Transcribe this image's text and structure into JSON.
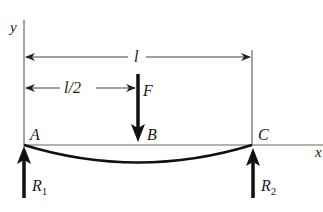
{
  "diagram": {
    "type": "simply-supported-beam",
    "axes": {
      "x_label": "x",
      "y_label": "y"
    },
    "points": [
      {
        "label": "A",
        "description": "left support"
      },
      {
        "label": "B",
        "description": "load point at midspan"
      },
      {
        "label": "C",
        "description": "right support"
      }
    ],
    "dimensions": {
      "span_label": "l",
      "half_span_label": "l/2"
    },
    "load": {
      "label": "F",
      "direction": "down"
    },
    "reactions": {
      "left": {
        "label": "R",
        "subscript": "1"
      },
      "right": {
        "label": "R",
        "subscript": "2"
      }
    },
    "colors": {
      "line": "#555555",
      "beam": "#111111",
      "arrow": "#111111",
      "text": "#1a1a1a"
    }
  }
}
